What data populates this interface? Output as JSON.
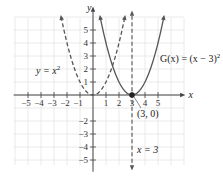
{
  "chart_data": {
    "type": "line",
    "title": "",
    "xlabel": "x",
    "ylabel": "y",
    "xlim": [
      -6,
      6
    ],
    "ylim": [
      -6,
      6
    ],
    "grid": true,
    "x_ticks": [
      -5,
      -4,
      -3,
      -2,
      -1,
      1,
      2,
      3,
      4,
      5
    ],
    "x_tick_labels": [
      "−5",
      "−4",
      "−3",
      "−2",
      "−1",
      "1",
      "2",
      "3",
      "4",
      "5"
    ],
    "y_ticks": [
      5,
      4,
      3,
      2,
      1,
      -2,
      -3,
      -4,
      -5
    ],
    "y_tick_labels": [
      "5",
      "4",
      "3",
      "2",
      "1",
      "−2",
      "−3",
      "−4",
      "−5"
    ],
    "series": [
      {
        "name": "y = x^2",
        "label": "y = x",
        "label_sup": "2",
        "style": "dashed",
        "color": "#555555",
        "equation": "x^2",
        "x": [
          -2.4,
          -2,
          -1,
          0,
          1,
          2,
          2.4
        ],
        "y": [
          5.76,
          4,
          1,
          0,
          1,
          4,
          5.76
        ]
      },
      {
        "name": "G(x) = (x − 3)^2",
        "label": "G(x) = (x − 3)",
        "label_sup": "2",
        "style": "solid",
        "color": "#555555",
        "equation": "(x-3)^2",
        "x": [
          0.6,
          1,
          2,
          3,
          4,
          5,
          5.4
        ],
        "y": [
          5.76,
          4,
          1,
          0,
          1,
          4,
          5.76
        ]
      },
      {
        "name": "x = 3",
        "label": "x = 3",
        "style": "dashed",
        "color": "#555555",
        "type": "vertical-line",
        "x_value": 3
      }
    ],
    "annotations": [
      {
        "text": "(3, 0)",
        "point": [
          3,
          0
        ]
      }
    ]
  }
}
